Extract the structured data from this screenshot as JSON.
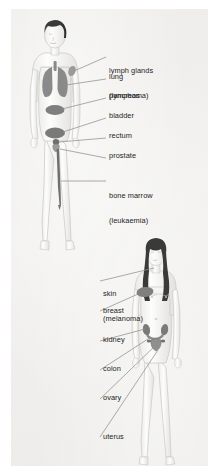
{
  "diagram": {
    "panel_background": "#f1f0ee",
    "label_color": "#242424",
    "leader_line_color": "#8f8f8f",
    "organ_fill": "#8a8a8a",
    "organ_fill_dark": "#6f6f6f",
    "hair_color": "#3a3a3a",
    "body_outline": "#c9c7c3",
    "body_fill": "#fbfbfa"
  },
  "figures": [
    {
      "id": "male-figure",
      "sex": "male",
      "position": "upper-left",
      "hair": "short dark hair",
      "labels": [
        {
          "id": "lymph-glands",
          "lines": [
            "lymph glands",
            "(lymphoma)"
          ],
          "x": 98,
          "y": 45
        },
        {
          "id": "lung",
          "lines": [
            "lung"
          ],
          "x": 98,
          "y": 68
        },
        {
          "id": "pancreas",
          "lines": [
            "pancreas"
          ],
          "x": 98,
          "y": 87
        },
        {
          "id": "bladder",
          "lines": [
            "bladder"
          ],
          "x": 98,
          "y": 107
        },
        {
          "id": "rectum",
          "lines": [
            "rectum"
          ],
          "x": 98,
          "y": 127
        },
        {
          "id": "prostate",
          "lines": [
            "prostate"
          ],
          "x": 98,
          "y": 147
        },
        {
          "id": "bone-marrow",
          "lines": [
            "bone marrow",
            "(leukaemia)"
          ],
          "x": 98,
          "y": 170
        }
      ]
    },
    {
      "id": "female-figure",
      "sex": "female",
      "position": "lower-right",
      "hair": "long dark hair",
      "labels": [
        {
          "id": "skin",
          "lines": [
            "skin",
            "(melanoma)"
          ],
          "x": 92,
          "y": 268
        },
        {
          "id": "breast",
          "lines": [
            "breast"
          ],
          "x": 92,
          "y": 302
        },
        {
          "id": "kidney",
          "lines": [
            "kidney"
          ],
          "x": 92,
          "y": 331
        },
        {
          "id": "colon",
          "lines": [
            "colon"
          ],
          "x": 92,
          "y": 360
        },
        {
          "id": "ovary",
          "lines": [
            "ovary"
          ],
          "x": 92,
          "y": 389
        },
        {
          "id": "uterus",
          "lines": [
            "uterus"
          ],
          "x": 92,
          "y": 428
        }
      ]
    }
  ]
}
